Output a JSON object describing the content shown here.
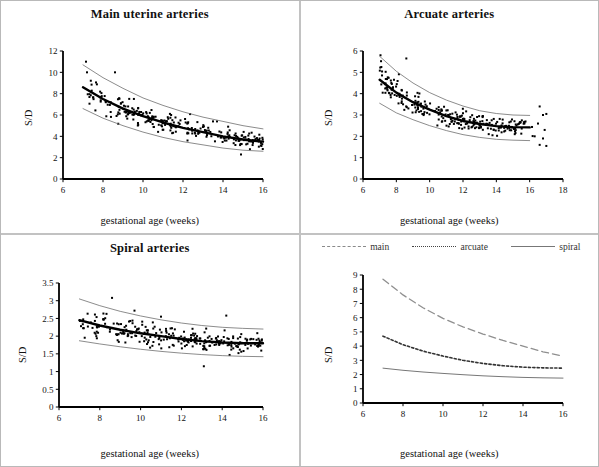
{
  "figure": {
    "xlabel": "gestational age (weeks)",
    "ylabel": "S/D"
  },
  "panels": {
    "p1_title": "Main uterine arteries",
    "p2_title": "Arcuate arteries",
    "p3_title": "Spiral arteries",
    "p4_title": ""
  },
  "legend": {
    "main": "main",
    "arcuate": "arcuate",
    "spiral": "spiral"
  },
  "chart_data": [
    {
      "type": "scatter",
      "title": "Main uterine arteries",
      "xlabel": "gestational age (weeks)",
      "ylabel": "S/D",
      "xlim": [
        6,
        16
      ],
      "ylim": [
        0,
        12
      ],
      "xticks": [
        6,
        8,
        10,
        12,
        14,
        16
      ],
      "yticks": [
        0,
        2,
        4,
        6,
        8,
        10,
        12
      ],
      "grid": false,
      "legend_position": "none",
      "series": [
        {
          "name": "mean",
          "style": "thick-solid-black",
          "x": [
            7,
            8,
            9,
            10,
            11,
            12,
            13,
            14,
            15,
            16
          ],
          "values": [
            8.6,
            7.5,
            6.6,
            5.9,
            5.3,
            4.8,
            4.4,
            4.0,
            3.7,
            3.5
          ]
        },
        {
          "name": "upper-bound",
          "style": "thin-solid-gray",
          "x": [
            7,
            8,
            9,
            10,
            11,
            12,
            13,
            14,
            15,
            16
          ],
          "values": [
            10.7,
            9.5,
            8.5,
            7.6,
            6.9,
            6.3,
            5.8,
            5.4,
            5.0,
            4.7
          ]
        },
        {
          "name": "lower-bound",
          "style": "thin-solid-gray",
          "x": [
            7,
            8,
            9,
            10,
            11,
            12,
            13,
            14,
            15,
            16
          ],
          "values": [
            6.6,
            5.7,
            5.0,
            4.4,
            3.9,
            3.5,
            3.2,
            2.9,
            2.7,
            2.6
          ]
        }
      ],
      "scatter_n": 260,
      "scatter_note": "dense black square markers filling the band, x from 7 to 16, a few outliers near 10-11 S/D at week 7-8.6"
    },
    {
      "type": "scatter",
      "title": "Arcuate arteries",
      "xlabel": "gestational age (weeks)",
      "ylabel": "S/D",
      "xlim": [
        6,
        18
      ],
      "ylim": [
        0,
        6
      ],
      "xticks": [
        6,
        8,
        10,
        12,
        14,
        16,
        18
      ],
      "yticks": [
        0,
        1,
        2,
        3,
        4,
        5,
        6
      ],
      "grid": false,
      "legend_position": "none",
      "series": [
        {
          "name": "mean",
          "style": "thick-solid-black",
          "x": [
            7,
            8,
            9,
            10,
            11,
            12,
            13,
            14,
            15,
            16
          ],
          "values": [
            4.65,
            4.05,
            3.6,
            3.25,
            2.95,
            2.72,
            2.58,
            2.48,
            2.43,
            2.42
          ]
        },
        {
          "name": "upper-bound",
          "style": "thin-solid-gray",
          "x": [
            7,
            8,
            9,
            10,
            11,
            12,
            13,
            14,
            15,
            16
          ],
          "values": [
            5.75,
            5.05,
            4.5,
            4.05,
            3.7,
            3.42,
            3.2,
            3.07,
            3.0,
            2.98
          ]
        },
        {
          "name": "lower-bound",
          "style": "thin-solid-gray",
          "x": [
            7,
            8,
            9,
            10,
            11,
            12,
            13,
            14,
            15,
            16
          ],
          "values": [
            3.55,
            3.1,
            2.78,
            2.5,
            2.27,
            2.08,
            1.95,
            1.86,
            1.82,
            1.8
          ]
        }
      ],
      "scatter_n": 250,
      "scatter_note": "dense black squares from week 7 to about 17; outliers near 5.65 at 8.6 and 5.8 at 7"
    },
    {
      "type": "scatter",
      "title": "Spiral arteries",
      "xlabel": "gestational age (weeks)",
      "ylabel": "S/D",
      "xlim": [
        6,
        16
      ],
      "ylim": [
        0,
        3.5
      ],
      "xticks": [
        6,
        8,
        10,
        12,
        14,
        16
      ],
      "yticks": [
        0,
        0.5,
        1,
        1.5,
        2,
        2.5,
        3,
        3.5
      ],
      "grid": false,
      "legend_position": "none",
      "series": [
        {
          "name": "mean",
          "style": "thick-solid-black",
          "x": [
            7,
            8,
            9,
            10,
            11,
            12,
            13,
            14,
            15,
            16
          ],
          "values": [
            2.45,
            2.3,
            2.18,
            2.08,
            2.0,
            1.92,
            1.86,
            1.82,
            1.8,
            1.8
          ]
        },
        {
          "name": "upper-bound",
          "style": "thin-solid-gray",
          "x": [
            7,
            8,
            9,
            10,
            11,
            12,
            13,
            14,
            15,
            16
          ],
          "values": [
            3.05,
            2.86,
            2.7,
            2.57,
            2.46,
            2.37,
            2.3,
            2.25,
            2.22,
            2.2
          ]
        },
        {
          "name": "lower-bound",
          "style": "thin-solid-gray",
          "x": [
            7,
            8,
            9,
            10,
            11,
            12,
            13,
            14,
            15,
            16
          ],
          "values": [
            1.87,
            1.78,
            1.7,
            1.63,
            1.57,
            1.52,
            1.48,
            1.45,
            1.43,
            1.42
          ]
        }
      ],
      "scatter_n": 255,
      "scatter_note": "dense black squares, outlier near 3.1 at week 8.6"
    },
    {
      "type": "line",
      "title": "",
      "xlabel": "gestational age (weeks)",
      "ylabel": "S/D",
      "xlim": [
        6,
        16
      ],
      "ylim": [
        0,
        9
      ],
      "xticks": [
        6,
        8,
        10,
        12,
        14,
        16
      ],
      "yticks": [
        0,
        1,
        2,
        3,
        4,
        5,
        6,
        7,
        8,
        9
      ],
      "grid": false,
      "legend_position": "top",
      "x": [
        7,
        8,
        9,
        10,
        11,
        12,
        13,
        14,
        15,
        16
      ],
      "series": [
        {
          "name": "main",
          "style": "long-dash",
          "values": [
            8.7,
            7.6,
            6.7,
            5.95,
            5.35,
            4.85,
            4.4,
            4.0,
            3.6,
            3.3
          ]
        },
        {
          "name": "arcuate",
          "style": "dotted",
          "values": [
            4.7,
            4.1,
            3.65,
            3.3,
            3.0,
            2.78,
            2.62,
            2.52,
            2.47,
            2.45
          ]
        },
        {
          "name": "spiral",
          "style": "solid",
          "values": [
            2.45,
            2.3,
            2.18,
            2.08,
            1.99,
            1.91,
            1.85,
            1.8,
            1.77,
            1.75
          ]
        }
      ]
    }
  ]
}
